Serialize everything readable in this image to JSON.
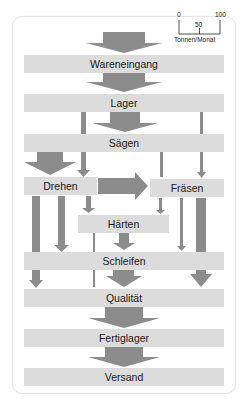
{
  "diagram": {
    "type": "sankey-material-flow",
    "nodes": [
      {
        "id": "wareneingang",
        "label": "Wareneingang"
      },
      {
        "id": "lager",
        "label": "Lager"
      },
      {
        "id": "saegen",
        "label": "Sägen"
      },
      {
        "id": "drehen",
        "label": "Drehen"
      },
      {
        "id": "fraesen",
        "label": "Fräsen"
      },
      {
        "id": "haerten",
        "label": "Härten"
      },
      {
        "id": "schleifen",
        "label": "Schleifen"
      },
      {
        "id": "qualitaet",
        "label": "Qualität"
      },
      {
        "id": "fertiglager",
        "label": "Fertiglager"
      },
      {
        "id": "versand",
        "label": "Versand"
      }
    ],
    "flows": [
      {
        "from": "input",
        "to": "wareneingang",
        "approx_value": 100
      },
      {
        "from": "wareneingang",
        "to": "lager",
        "approx_value": 100
      },
      {
        "from": "lager",
        "to": "saegen",
        "approx_value": 65
      },
      {
        "from": "lager",
        "to": "drehen",
        "approx_value": 15
      },
      {
        "from": "lager",
        "to": "fraesen",
        "approx_value": 10
      },
      {
        "from": "saegen",
        "to": "drehen",
        "approx_value": 60
      },
      {
        "from": "saegen",
        "to": "fraesen",
        "approx_value": 8
      },
      {
        "from": "drehen",
        "to": "fraesen",
        "approx_value": 55
      },
      {
        "from": "drehen",
        "to": "qualitaet",
        "approx_value": 20
      },
      {
        "from": "drehen",
        "to": "schleifen",
        "approx_value": 20
      },
      {
        "from": "drehen",
        "to": "haerten",
        "approx_value": 12
      },
      {
        "from": "fraesen",
        "to": "haerten",
        "approx_value": 8
      },
      {
        "from": "fraesen",
        "to": "schleifen",
        "approx_value": 10
      },
      {
        "from": "fraesen",
        "to": "qualitaet",
        "approx_value": 30
      },
      {
        "from": "haerten",
        "to": "schleifen",
        "approx_value": 15
      },
      {
        "from": "haerten",
        "to": "qualitaet",
        "approx_value": 5
      },
      {
        "from": "schleifen",
        "to": "qualitaet",
        "approx_value": 40
      },
      {
        "from": "qualitaet",
        "to": "fertiglager",
        "approx_value": 100
      },
      {
        "from": "fertiglager",
        "to": "versand",
        "approx_value": 100
      }
    ],
    "colors": {
      "node_fill": "#dcdcdc",
      "flow_fill": "#8c8c8c",
      "text": "#1a1a1a"
    }
  },
  "scale": {
    "ticks": [
      "0",
      "50",
      "100"
    ],
    "unit": "Tonnen/Monat"
  }
}
